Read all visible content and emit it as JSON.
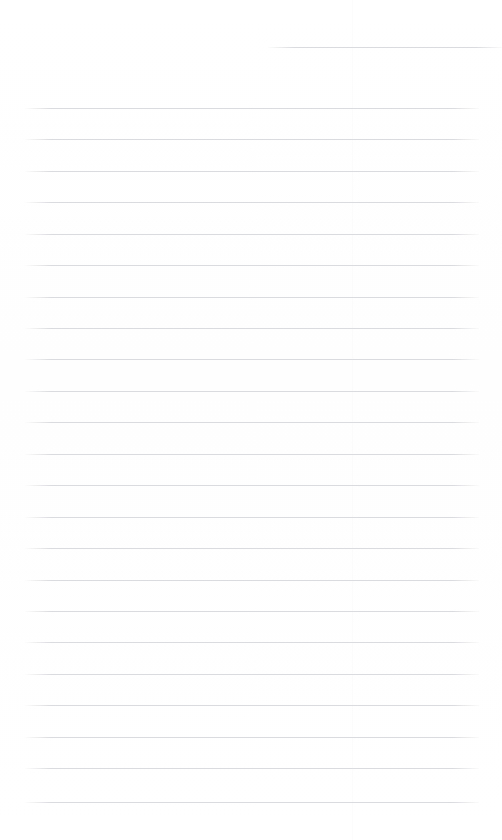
{
  "document": {
    "kind": "scanned-ruled-notebook-page",
    "page_width": 502,
    "page_height": 840,
    "background_color": "#ffffff",
    "text_content": "",
    "has_visible_text": false
  },
  "ruling": {
    "line_color": "#d9dadd",
    "line_thickness": 1,
    "line_spacing": 31.5,
    "full_line_left": 25,
    "full_line_right": 479,
    "partial_line_left": 268,
    "partial_line_right": 502,
    "first_line_y": 47,
    "lines": [
      {
        "y": 47,
        "left": 268,
        "right": 502,
        "partial": true
      },
      {
        "y": 108,
        "left": 25,
        "right": 479,
        "partial": false
      },
      {
        "y": 139,
        "left": 25,
        "right": 479,
        "partial": false
      },
      {
        "y": 171,
        "left": 25,
        "right": 479,
        "partial": false
      },
      {
        "y": 202,
        "left": 25,
        "right": 479,
        "partial": false
      },
      {
        "y": 234,
        "left": 25,
        "right": 479,
        "partial": false
      },
      {
        "y": 265,
        "left": 25,
        "right": 479,
        "partial": false
      },
      {
        "y": 297,
        "left": 25,
        "right": 479,
        "partial": false
      },
      {
        "y": 328,
        "left": 25,
        "right": 479,
        "partial": false
      },
      {
        "y": 359,
        "left": 25,
        "right": 479,
        "partial": false
      },
      {
        "y": 391,
        "left": 25,
        "right": 479,
        "partial": false
      },
      {
        "y": 422,
        "left": 25,
        "right": 479,
        "partial": false
      },
      {
        "y": 454,
        "left": 25,
        "right": 479,
        "partial": false
      },
      {
        "y": 485,
        "left": 25,
        "right": 479,
        "partial": false
      },
      {
        "y": 517,
        "left": 25,
        "right": 479,
        "partial": false
      },
      {
        "y": 548,
        "left": 25,
        "right": 479,
        "partial": false
      },
      {
        "y": 580,
        "left": 25,
        "right": 479,
        "partial": false
      },
      {
        "y": 611,
        "left": 25,
        "right": 479,
        "partial": false
      },
      {
        "y": 642,
        "left": 25,
        "right": 479,
        "partial": false
      },
      {
        "y": 674,
        "left": 25,
        "right": 479,
        "partial": false
      },
      {
        "y": 705,
        "left": 25,
        "right": 479,
        "partial": false
      },
      {
        "y": 737,
        "left": 25,
        "right": 479,
        "partial": false
      },
      {
        "y": 768,
        "left": 25,
        "right": 479,
        "partial": false
      },
      {
        "y": 802,
        "left": 25,
        "right": 479,
        "partial": false
      }
    ]
  }
}
